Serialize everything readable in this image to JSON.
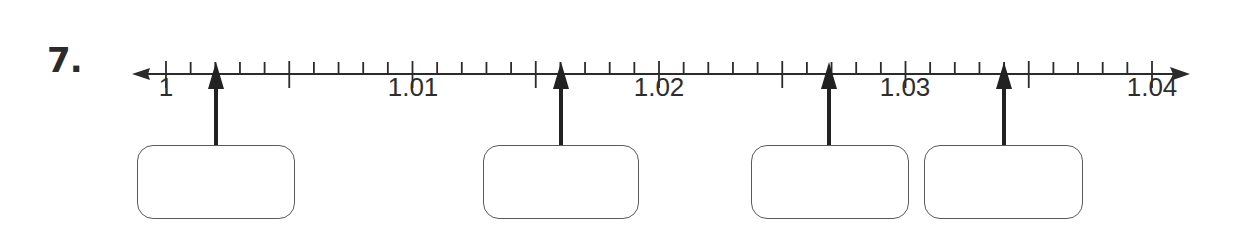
{
  "problem": {
    "number_label": "7.",
    "instruction": ""
  },
  "number_line": {
    "min": 1,
    "max": 1.04,
    "pixel_start": 166,
    "pixel_end": 1152,
    "minor_step": 0.001,
    "major_step": 0.005,
    "line_y": 74,
    "line_color": "#2b2b2b",
    "labels": [
      {
        "value": 1,
        "text": "1",
        "x": 166
      },
      {
        "value": 1.01,
        "text": "1.01",
        "x": 413
      },
      {
        "value": 1.02,
        "text": "1.02",
        "x": 659
      },
      {
        "value": 1.03,
        "text": "1.03",
        "x": 905
      },
      {
        "value": 1.04,
        "text": "1.04",
        "x": 1152
      }
    ]
  },
  "pointers": [
    {
      "id": 1,
      "x": 216,
      "value": 1.004,
      "box": {
        "left": 137,
        "width": 158,
        "answer": ""
      }
    },
    {
      "id": 2,
      "x": 561,
      "value": 1.016,
      "box": {
        "left": 483,
        "width": 156,
        "answer": ""
      }
    },
    {
      "id": 3,
      "x": 829,
      "value": 1.027,
      "box": {
        "left": 751,
        "width": 158,
        "answer": ""
      }
    },
    {
      "id": 4,
      "x": 1004,
      "value": 1.034,
      "box": {
        "left": 924,
        "width": 159,
        "answer": ""
      }
    }
  ]
}
